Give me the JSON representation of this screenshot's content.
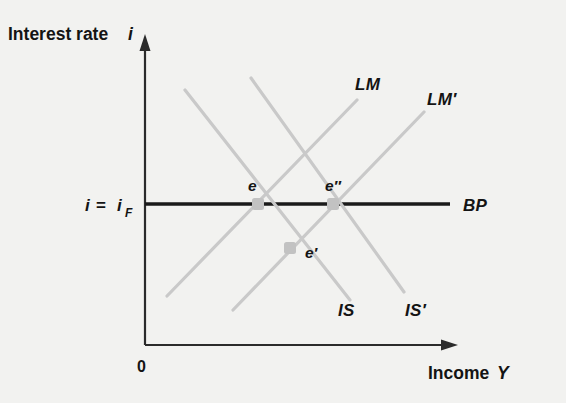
{
  "figure": {
    "type": "economics-diagram",
    "model": "IS-LM-BP",
    "background_color": "#f2f2f0",
    "curve_color": "#c9c9c9",
    "axis_color": "#2b2b2b",
    "bp_color": "#1a1a1a"
  },
  "axes": {
    "y_label_text": "Interest rate",
    "y_label_var": "i",
    "x_label_text": "Income",
    "x_label_var": "Y",
    "origin_label": "0",
    "y_tick_label_lhs": "i",
    "y_tick_label_eq": "=",
    "y_tick_label_rhs": "i",
    "y_tick_label_sub": "F"
  },
  "curves": [
    {
      "name": "IS",
      "label": "IS",
      "kind": "downward-sloping",
      "x1": 185,
      "y1": 90,
      "x2": 350,
      "y2": 300,
      "label_x": 338,
      "label_y": 316
    },
    {
      "name": "IS'",
      "label": "IS′",
      "kind": "downward-sloping",
      "x1": 251,
      "y1": 78,
      "x2": 404,
      "y2": 292,
      "label_x": 405,
      "label_y": 316
    },
    {
      "name": "LM",
      "label": "LM",
      "kind": "upward-sloping",
      "x1": 167,
      "y1": 296,
      "x2": 357,
      "y2": 100,
      "label_x": 355,
      "label_y": 90
    },
    {
      "name": "LM'",
      "label": "LM′",
      "kind": "upward-sloping",
      "x1": 233,
      "y1": 310,
      "x2": 424,
      "y2": 112,
      "label_x": 427,
      "label_y": 105
    }
  ],
  "bp_line": {
    "label": "BP",
    "y": 204,
    "x_start": 145,
    "x_end": 450,
    "label_x": 463,
    "label_y": 211
  },
  "equilibria": [
    {
      "name": "e",
      "label": "e",
      "x": 258,
      "y": 204,
      "label_x": 248,
      "label_y": 191
    },
    {
      "name": "e'",
      "label": "e′",
      "x": 290,
      "y": 248,
      "label_x": 305,
      "label_y": 258
    },
    {
      "name": "e''",
      "label": "e″",
      "x": 333,
      "y": 204,
      "label_x": 325,
      "label_y": 191
    }
  ],
  "geometry": {
    "y_axis_x": 145,
    "y_axis_top": 44,
    "y_axis_bottom": 345,
    "x_axis_y": 345,
    "x_axis_left": 145,
    "x_axis_right": 455
  }
}
